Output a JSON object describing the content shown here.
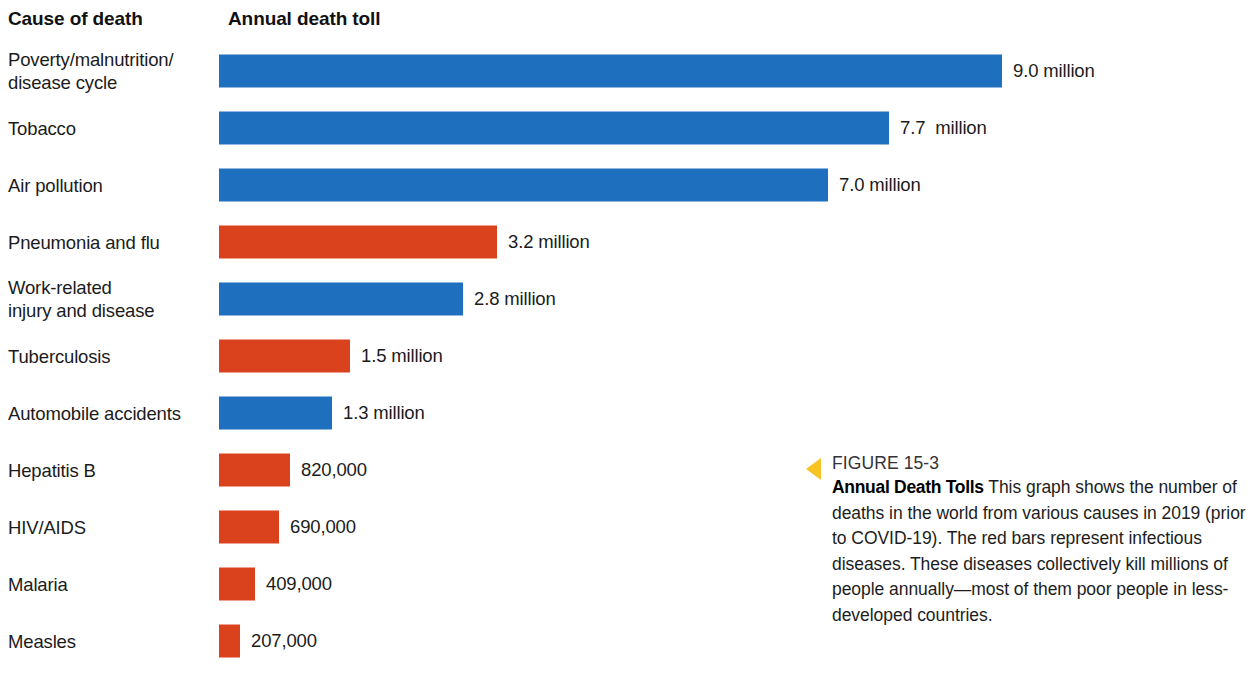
{
  "headers": {
    "cause": "Cause of death",
    "toll": "Annual death toll"
  },
  "chart_data": {
    "type": "bar",
    "orientation": "horizontal",
    "title": "Annual Death Tolls",
    "xlabel": "Annual death toll",
    "ylabel": "Cause of death",
    "grid": false,
    "legend": "none",
    "xlim": [
      0,
      9.5
    ],
    "units": "deaths per year",
    "scale_px_per_million": 87,
    "categories": [
      "Poverty/malnutrition/\ndisease cycle",
      "Tobacco",
      "Air pollution",
      "Pneumonia and flu",
      "Work-related\ninjury and disease",
      "Tuberculosis",
      "Automobile accidents",
      "Hepatitis B",
      "HIV/AIDS",
      "Malaria",
      "Measles"
    ],
    "values": [
      9.0,
      7.7,
      7.0,
      3.2,
      2.8,
      1.5,
      1.3,
      0.82,
      0.69,
      0.409,
      0.207
    ],
    "value_labels": [
      "9.0 million",
      "7.7  million",
      "7.0 million",
      "3.2 million",
      "2.8 million",
      "1.5 million",
      "1.3 million",
      "820,000",
      "690,000",
      "409,000",
      "207,000"
    ],
    "colors": {
      "blue": "#1f6fbf",
      "red": "#da421d"
    },
    "color_meaning": {
      "red": "infectious diseases",
      "blue": "non-infectious causes"
    },
    "rows": [
      {
        "label": "Poverty/malnutrition/\ndisease cycle",
        "value": 9.0,
        "value_label": "9.0 million",
        "color": "blue"
      },
      {
        "label": "Tobacco",
        "value": 7.7,
        "value_label": "7.7  million",
        "color": "blue"
      },
      {
        "label": "Air pollution",
        "value": 7.0,
        "value_label": "7.0 million",
        "color": "blue"
      },
      {
        "label": "Pneumonia and flu",
        "value": 3.2,
        "value_label": "3.2 million",
        "color": "red"
      },
      {
        "label": "Work-related\ninjury and disease",
        "value": 2.8,
        "value_label": "2.8 million",
        "color": "blue"
      },
      {
        "label": "Tuberculosis",
        "value": 1.5,
        "value_label": "1.5 million",
        "color": "red"
      },
      {
        "label": "Automobile accidents",
        "value": 1.3,
        "value_label": "1.3 million",
        "color": "blue"
      },
      {
        "label": "Hepatitis B",
        "value": 0.82,
        "value_label": "820,000",
        "color": "red"
      },
      {
        "label": "HIV/AIDS",
        "value": 0.69,
        "value_label": "690,000",
        "color": "red"
      },
      {
        "label": "Malaria",
        "value": 0.409,
        "value_label": "409,000",
        "color": "red"
      },
      {
        "label": "Measles",
        "value": 0.207,
        "value_label": "207,000",
        "color": "red"
      }
    ]
  },
  "caption": {
    "marker": "left-triangle-icon",
    "marker_color": "#f7c325",
    "figure_number": "FIGURE 15-3",
    "title": "Annual Death Tolls",
    "text": " This graph shows the number of deaths in the world from various causes in 2019 (prior to COVID-19). The red bars represent infectious diseases. These diseases collectively kill millions of people annually—most of them poor people in less-developed countries."
  }
}
